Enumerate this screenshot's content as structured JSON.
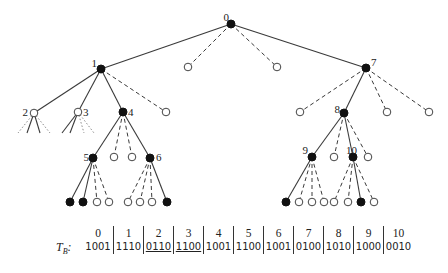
{
  "diagram": {
    "type": "search-tree",
    "nodes": [
      {
        "id": "0",
        "label": "0",
        "x": 231,
        "y": 24,
        "fill": "filled"
      },
      {
        "id": "1",
        "label": "1",
        "x": 101,
        "y": 69,
        "fill": "filled"
      },
      {
        "id": "h0a",
        "label": "",
        "x": 188,
        "y": 67,
        "fill": "hollow"
      },
      {
        "id": "h0b",
        "label": "",
        "x": 277,
        "y": 67,
        "fill": "hollow"
      },
      {
        "id": "7",
        "label": "7",
        "x": 366,
        "y": 68,
        "fill": "filled"
      },
      {
        "id": "2",
        "label": "2",
        "x": 34,
        "y": 113,
        "fill": "hollow"
      },
      {
        "id": "3",
        "label": "3",
        "x": 78,
        "y": 112,
        "fill": "hollow"
      },
      {
        "id": "4",
        "label": "4",
        "x": 123,
        "y": 112,
        "fill": "filled"
      },
      {
        "id": "h1a",
        "label": "",
        "x": 166,
        "y": 112,
        "fill": "hollow"
      },
      {
        "id": "h7a",
        "label": "",
        "x": 300,
        "y": 112,
        "fill": "hollow"
      },
      {
        "id": "8",
        "label": "8",
        "x": 344,
        "y": 113,
        "fill": "filled"
      },
      {
        "id": "h7b",
        "label": "",
        "x": 387,
        "y": 112,
        "fill": "hollow"
      },
      {
        "id": "h7c",
        "label": "",
        "x": 429,
        "y": 112,
        "fill": "hollow"
      },
      {
        "id": "5",
        "label": "5",
        "x": 93,
        "y": 158,
        "fill": "filled"
      },
      {
        "id": "h4a",
        "label": "",
        "x": 114,
        "y": 157,
        "fill": "hollow"
      },
      {
        "id": "h4b",
        "label": "",
        "x": 132,
        "y": 157,
        "fill": "hollow"
      },
      {
        "id": "6",
        "label": "6",
        "x": 150,
        "y": 158,
        "fill": "filled"
      },
      {
        "id": "9",
        "label": "9",
        "x": 312,
        "y": 157,
        "fill": "filled"
      },
      {
        "id": "h8a",
        "label": "",
        "x": 334,
        "y": 157,
        "fill": "hollow"
      },
      {
        "id": "10",
        "label": "10",
        "x": 353,
        "y": 157,
        "fill": "filled"
      },
      {
        "id": "h8b",
        "label": "",
        "x": 368,
        "y": 157,
        "fill": "hollow"
      },
      {
        "id": "l5a",
        "label": "",
        "x": 70,
        "y": 202,
        "fill": "filled"
      },
      {
        "id": "l5b",
        "label": "",
        "x": 83,
        "y": 202,
        "fill": "filled"
      },
      {
        "id": "l5c",
        "label": "",
        "x": 97,
        "y": 202,
        "fill": "hollow"
      },
      {
        "id": "l5d",
        "label": "",
        "x": 109,
        "y": 202,
        "fill": "hollow"
      },
      {
        "id": "l6a",
        "label": "",
        "x": 128,
        "y": 202,
        "fill": "hollow"
      },
      {
        "id": "l6b",
        "label": "",
        "x": 140,
        "y": 202,
        "fill": "hollow"
      },
      {
        "id": "l6c",
        "label": "",
        "x": 152,
        "y": 202,
        "fill": "hollow"
      },
      {
        "id": "l6d",
        "label": "",
        "x": 167,
        "y": 202,
        "fill": "filled"
      },
      {
        "id": "l9a",
        "label": "",
        "x": 286,
        "y": 202,
        "fill": "filled"
      },
      {
        "id": "l9b",
        "label": "",
        "x": 299,
        "y": 202,
        "fill": "hollow"
      },
      {
        "id": "l9c",
        "label": "",
        "x": 312,
        "y": 202,
        "fill": "hollow"
      },
      {
        "id": "l9d",
        "label": "",
        "x": 324,
        "y": 202,
        "fill": "hollow"
      },
      {
        "id": "l10a",
        "label": "",
        "x": 334,
        "y": 202,
        "fill": "hollow"
      },
      {
        "id": "l10b",
        "label": "",
        "x": 348,
        "y": 202,
        "fill": "hollow"
      },
      {
        "id": "l10c",
        "label": "",
        "x": 361,
        "y": 202,
        "fill": "filled"
      },
      {
        "id": "l10d",
        "label": "",
        "x": 374,
        "y": 202,
        "fill": "hollow"
      }
    ],
    "edges": [
      {
        "from": "0",
        "to": "1",
        "style": "solid"
      },
      {
        "from": "0",
        "to": "h0a",
        "style": "dashed"
      },
      {
        "from": "0",
        "to": "h0b",
        "style": "dashed"
      },
      {
        "from": "0",
        "to": "7",
        "style": "solid"
      },
      {
        "from": "1",
        "to": "2",
        "style": "solid"
      },
      {
        "from": "1",
        "to": "3",
        "style": "solid"
      },
      {
        "from": "1",
        "to": "4",
        "style": "solid"
      },
      {
        "from": "1",
        "to": "h1a",
        "style": "dashed"
      },
      {
        "from": "4",
        "to": "5",
        "style": "solid"
      },
      {
        "from": "4",
        "to": "h4a",
        "style": "dashed"
      },
      {
        "from": "4",
        "to": "h4b",
        "style": "dashed"
      },
      {
        "from": "4",
        "to": "6",
        "style": "solid"
      },
      {
        "from": "5",
        "to": "l5a",
        "style": "solid"
      },
      {
        "from": "5",
        "to": "l5b",
        "style": "solid"
      },
      {
        "from": "5",
        "to": "l5c",
        "style": "dashed"
      },
      {
        "from": "5",
        "to": "l5d",
        "style": "dashed"
      },
      {
        "from": "6",
        "to": "l6a",
        "style": "dashed"
      },
      {
        "from": "6",
        "to": "l6b",
        "style": "dashed"
      },
      {
        "from": "6",
        "to": "l6c",
        "style": "dashed"
      },
      {
        "from": "6",
        "to": "l6d",
        "style": "solid"
      },
      {
        "from": "7",
        "to": "h7a",
        "style": "dashed"
      },
      {
        "from": "7",
        "to": "8",
        "style": "solid"
      },
      {
        "from": "7",
        "to": "h7b",
        "style": "dashed"
      },
      {
        "from": "7",
        "to": "h7c",
        "style": "dashed"
      },
      {
        "from": "8",
        "to": "9",
        "style": "solid"
      },
      {
        "from": "8",
        "to": "h8a",
        "style": "dashed"
      },
      {
        "from": "8",
        "to": "10",
        "style": "solid"
      },
      {
        "from": "8",
        "to": "h8b",
        "style": "dashed"
      },
      {
        "from": "9",
        "to": "l9a",
        "style": "solid"
      },
      {
        "from": "9",
        "to": "l9b",
        "style": "dashed"
      },
      {
        "from": "9",
        "to": "l9c",
        "style": "dashed"
      },
      {
        "from": "9",
        "to": "l9d",
        "style": "dashed"
      },
      {
        "from": "10",
        "to": "l10a",
        "style": "dashed"
      },
      {
        "from": "10",
        "to": "l10b",
        "style": "dashed"
      },
      {
        "from": "10",
        "to": "l10c",
        "style": "solid"
      },
      {
        "from": "10",
        "to": "l10d",
        "style": "dashed"
      }
    ],
    "stubs": [
      {
        "from": "2",
        "x2": 18,
        "y2": 133,
        "style": "dotted"
      },
      {
        "from": "2",
        "x2": 27,
        "y2": 133,
        "style": "solid"
      },
      {
        "from": "2",
        "x2": 40,
        "y2": 133,
        "style": "solid"
      },
      {
        "from": "2",
        "x2": 50,
        "y2": 133,
        "style": "dotted"
      },
      {
        "from": "3",
        "x2": 62,
        "y2": 133,
        "style": "solid"
      },
      {
        "from": "3",
        "x2": 70,
        "y2": 133,
        "style": "solid"
      },
      {
        "from": "3",
        "x2": 84,
        "y2": 133,
        "style": "dotted"
      },
      {
        "from": "3",
        "x2": 94,
        "y2": 133,
        "style": "dotted"
      }
    ],
    "label_offsets": {
      "0": [
        -8,
        -3
      ],
      "1": [
        -10,
        -2
      ],
      "7": [
        5,
        -2
      ],
      "2": [
        -12,
        3
      ],
      "3": [
        5,
        4
      ],
      "4": [
        5,
        4
      ],
      "5": [
        -10,
        3
      ],
      "6": [
        6,
        3
      ],
      "8": [
        -10,
        0
      ],
      "9": [
        -10,
        -3
      ],
      "10": [
        -2,
        -3
      ]
    }
  },
  "table": {
    "row_label": "T",
    "row_label_sub": "B",
    "row_label_suffix": ":",
    "columns": [
      {
        "index": "0",
        "value": "1001",
        "underlined": false
      },
      {
        "index": "1",
        "value": "1110",
        "underlined": false
      },
      {
        "index": "2",
        "value": "0110",
        "underlined": true
      },
      {
        "index": "3",
        "value": "1100",
        "underlined": true
      },
      {
        "index": "4",
        "value": "1001",
        "underlined": false
      },
      {
        "index": "5",
        "value": "1100",
        "underlined": false
      },
      {
        "index": "6",
        "value": "1001",
        "underlined": false
      },
      {
        "index": "7",
        "value": "0100",
        "underlined": false
      },
      {
        "index": "8",
        "value": "1010",
        "underlined": false
      },
      {
        "index": "9",
        "value": "1000",
        "underlined": false
      },
      {
        "index": "10",
        "value": "0010",
        "underlined": false
      }
    ]
  }
}
